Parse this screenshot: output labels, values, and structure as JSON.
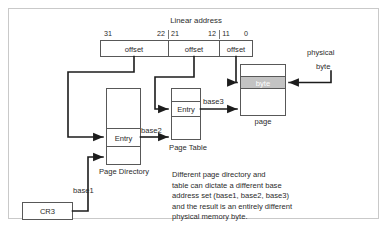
{
  "diagram": {
    "title": "Linear address",
    "bit_labels": [
      "31",
      "22",
      "21",
      "12",
      "11",
      "0"
    ],
    "address_fields": [
      {
        "label": "offset"
      },
      {
        "label": "offset"
      },
      {
        "label": "offset"
      }
    ],
    "physical_label_line1": "physical",
    "physical_label_line2": "byte",
    "page_box": {
      "byte_cell": "byte",
      "caption": "page"
    },
    "page_table": {
      "entry": "Entry",
      "caption": "Page Table"
    },
    "page_directory": {
      "entry": "Entry",
      "caption": "Page Directory"
    },
    "cr3": {
      "label": "CR3"
    },
    "base_labels": {
      "base1": "base1",
      "base2": "base2",
      "base3": "base3"
    },
    "note": {
      "lines": [
        "Different page directory and",
        "table can dictate a different base",
        "address set (base1, base2, base3)",
        "and the result is an entirely different",
        "physical memory byte."
      ]
    },
    "colors": {
      "byte_cell_fill": "#c3c3c3",
      "box_stroke": "#585858",
      "connector": "#1c1c1c",
      "frame": "#c9c9c9",
      "background": "#ffffff"
    }
  }
}
